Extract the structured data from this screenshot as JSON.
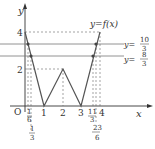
{
  "figure": {
    "type": "function-graph",
    "function_label": "y=f(x)",
    "axes": {
      "x_label": "x",
      "y_label": "y",
      "origin_label": "O"
    },
    "x_ticks": [
      "1",
      "2",
      "3",
      "4"
    ],
    "x_fraction_ticks": [
      {
        "num": "1",
        "den": "6",
        "value": 0.1667
      },
      {
        "num": "1",
        "den": "3",
        "value": 0.3333
      },
      {
        "num": "11",
        "den": "3",
        "value": 3.6667
      },
      {
        "num": "23",
        "den": "6",
        "value": 3.8333
      }
    ],
    "y_ticks": [
      "2",
      "4"
    ],
    "horizontal_lines": [
      {
        "label_prefix": "y=",
        "num": "10",
        "den": "3",
        "value": 3.3333
      },
      {
        "label_prefix": "y=",
        "num": "8",
        "den": "3",
        "value": 2.6667
      }
    ],
    "polyline_points": [
      [
        0,
        4
      ],
      [
        1,
        0
      ],
      [
        2,
        2
      ],
      [
        3,
        0
      ],
      [
        4,
        4
      ]
    ],
    "line_color": "#555555"
  }
}
